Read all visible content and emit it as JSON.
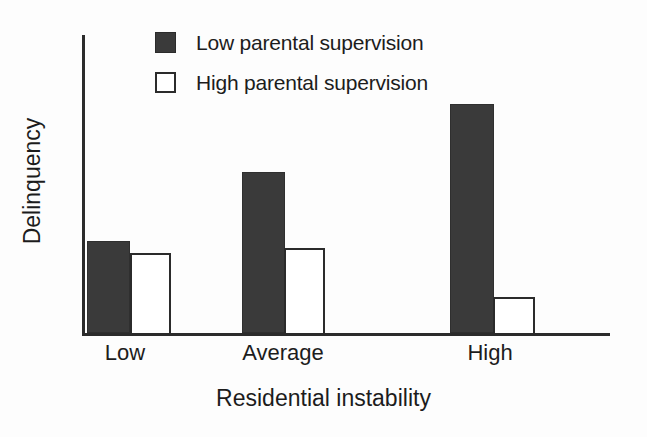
{
  "chart_data": {
    "type": "bar",
    "title": "",
    "xlabel": "Residential instability",
    "ylabel": "Delinquency",
    "categories": [
      "Low",
      "Average",
      "High"
    ],
    "series": [
      {
        "name": "Low parental supervision",
        "style": "filled",
        "color": "#3a3a3a",
        "values": [
          31,
          54,
          77
        ]
      },
      {
        "name": "High parental supervision",
        "style": "open",
        "color": "#ffffff",
        "outline": "#2b2b2b",
        "values": [
          27,
          28.5,
          12
        ]
      }
    ],
    "ylim": [
      0,
      100
    ],
    "axis_ticks_shown": false,
    "grid": false,
    "legend_position": "top-center"
  },
  "legend": {
    "items": [
      {
        "label": "Low parental supervision",
        "swatch": "filled-square-icon"
      },
      {
        "label": "High parental supervision",
        "swatch": "open-square-icon"
      }
    ]
  },
  "axes": {
    "x_title": "Residential instability",
    "y_title": "Delinquency",
    "x_tick_labels": [
      "Low",
      "Average",
      "High"
    ]
  },
  "colors": {
    "bar_dark": "#3a3a3a",
    "bar_light": "#ffffff",
    "outline": "#2b2b2b",
    "axis": "#2b2b2b",
    "text": "#1c1c1c",
    "background": "#fdfdfd"
  }
}
